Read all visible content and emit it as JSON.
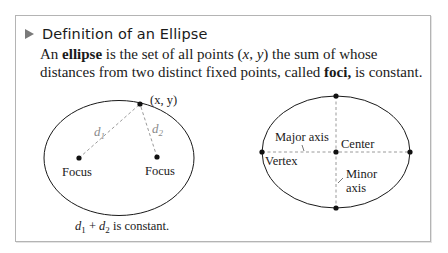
{
  "box": {
    "title": "Definition of an Ellipse",
    "definition": {
      "part1": "An ",
      "term": "ellipse",
      "part2": " is the set of all points (",
      "x": "x",
      "comma": ", ",
      "y": "y",
      "part3": ") the sum of whose distances from two distinct fixed points, called ",
      "foci_term": "foci,",
      "part4": " is constant."
    }
  },
  "left_figure": {
    "point_label": "(x, y)",
    "d1_label": "d",
    "d1_sub": "1",
    "d2_label": "d",
    "d2_sub": "2",
    "focus1_label": "Focus",
    "focus2_label": "Focus",
    "caption_d1": "d",
    "caption_sub1": "1",
    "caption_plus": " + ",
    "caption_d2": "d",
    "caption_sub2": "2",
    "caption_rest": " is constant."
  },
  "right_figure": {
    "major_axis_label": "Major axis",
    "center_label": "Center",
    "vertex_label": "Vertex",
    "minor_axis_label_line1": "Minor",
    "minor_axis_label_line2": "axis"
  },
  "colors": {
    "triangle": "#7a7a7a",
    "border": "#b4b4b4",
    "dashed": "#9a9a9a",
    "ink": "#1a1a1a"
  }
}
